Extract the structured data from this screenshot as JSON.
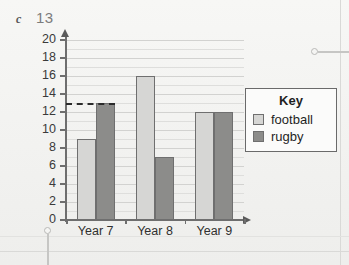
{
  "question": {
    "letter": "c",
    "number": "13"
  },
  "legend": {
    "title": "Key",
    "entries": [
      {
        "label": "football",
        "color": "#d6d6d4"
      },
      {
        "label": "rugby",
        "color": "#8c8c8a"
      }
    ]
  },
  "annotations": {
    "dashed_guide_value": "13",
    "callouts": [
      {
        "name": "top-right-callout"
      },
      {
        "name": "bottom-left-callout"
      }
    ]
  },
  "chart_data": {
    "type": "bar",
    "title": "",
    "xlabel": "",
    "ylabel": "",
    "categories": [
      "Year 7",
      "Year 8",
      "Year 9"
    ],
    "series": [
      {
        "name": "football",
        "values": [
          9,
          16,
          12
        ],
        "color": "#d6d6d4"
      },
      {
        "name": "rugby",
        "values": [
          13,
          7,
          12
        ],
        "color": "#8c8c8a"
      }
    ],
    "ylim": [
      0,
      20
    ],
    "ytick_step": 2,
    "yticks": [
      0,
      2,
      4,
      6,
      8,
      10,
      12,
      14,
      16,
      18,
      20
    ],
    "ytick_labels": [
      "0",
      "2",
      "4",
      "6",
      "8",
      "10",
      "12",
      "14",
      "16",
      "18",
      "20"
    ],
    "minor_gridline_step": 1,
    "grid": true,
    "legend_position": "right",
    "annotation_line": {
      "type": "dashed-horizontal",
      "value": 13,
      "from_category": "Year 7",
      "series": "rugby"
    }
  }
}
